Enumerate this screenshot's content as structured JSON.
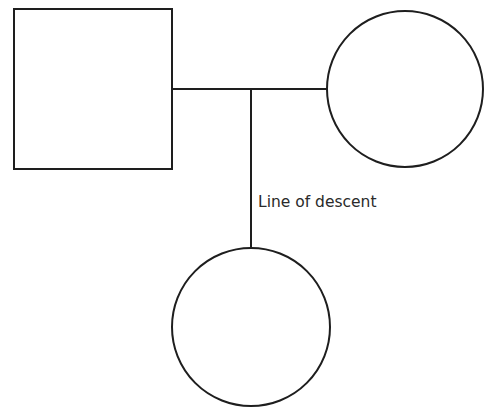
{
  "diagram": {
    "type": "pedigree",
    "nodes": [
      {
        "id": "father",
        "shape": "square",
        "label": ""
      },
      {
        "id": "mother",
        "shape": "circle",
        "label": ""
      },
      {
        "id": "child",
        "shape": "circle",
        "label": ""
      }
    ],
    "edges": [
      {
        "from": "father",
        "to": "mother",
        "kind": "marriage-line"
      },
      {
        "from": "marriage-line",
        "to": "child",
        "kind": "line-of-descent"
      }
    ],
    "labels": {
      "descent": "Line of descent"
    },
    "colors": {
      "stroke": "#1e1e1e",
      "text": "#2a2a2a",
      "background": "#ffffff"
    }
  }
}
